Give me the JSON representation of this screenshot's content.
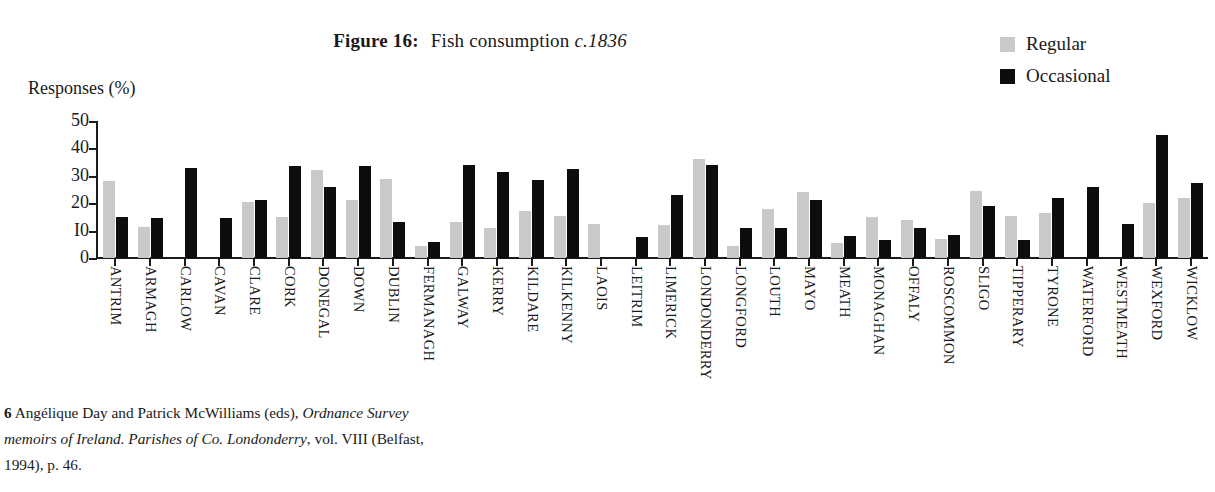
{
  "title": {
    "label": "Figure 16:",
    "caption": "Fish consumption",
    "circa": "c.1836",
    "full": "Figure 16: Fish consumption c.1836"
  },
  "legend": {
    "position": "top-right",
    "items": [
      {
        "label": "Regular",
        "color": "#c9c9c9",
        "key": "regular"
      },
      {
        "label": "Occasional",
        "color": "#0d0d0d",
        "key": "occasional"
      }
    ]
  },
  "axes": {
    "ylabel": "Responses (%)",
    "ytick_labels": [
      "50",
      "40",
      "30",
      "20",
      "I0",
      "0"
    ],
    "ytick_values": [
      50,
      40,
      30,
      20,
      10,
      0
    ],
    "xlabel": ""
  },
  "footnote": {
    "number": "6",
    "part1": "Angélique Day and Patrick McWilliams (eds), ",
    "italic1": "Ordnance Survey memoirs of Ireland. Parishes of Co. Londonderry",
    "part2": ", vol. VIII (Belfast, 1994), p. 46.",
    "full": "6 Angélique Day and Patrick McWilliams (eds), Ordnance Survey memoirs of Ireland. Parishes of Co. Londonderry, vol. VIII (Belfast, 1994), p. 46."
  },
  "chart_data": {
    "type": "bar",
    "title": "Figure 16: Fish consumption c.1836",
    "xlabel": "",
    "ylabel": "Responses (%)",
    "ylim": [
      0,
      50
    ],
    "ytick_step": 10,
    "grid": false,
    "legend_position": "top-right",
    "categories": [
      "ANTRIM",
      "ARMAGH",
      "CARLOW",
      "CAVAN",
      "CLARE",
      "CORK",
      "DONEGAL",
      "DOWN",
      "DUBLIN",
      "FERMANAGH",
      "GALWAY",
      "KERRY",
      "KILDARE",
      "KILKENNY",
      "LAOIS",
      "LEITRIM",
      "LIMERICK",
      "LONDONDERRY",
      "LONGFORD",
      "LOUTH",
      "MAYO",
      "MEATH",
      "MONAGHAN",
      "OFFALY",
      "ROSCOMMON",
      "SLIGO",
      "TIPPERARY",
      "TYRONE",
      "WATERFORD",
      "WESTMEATH",
      "WEXFORD",
      "WICKLOW"
    ],
    "series": [
      {
        "name": "Regular",
        "color": "#c9c9c9",
        "values": [
          28,
          11.5,
          0,
          0,
          20.5,
          15,
          32,
          21,
          29,
          4.5,
          13,
          11,
          17,
          15.5,
          12.5,
          0,
          12,
          36,
          4.5,
          18,
          24,
          5.5,
          15,
          14,
          7,
          24.5,
          15.5,
          16.5,
          0,
          0,
          20,
          22
        ]
      },
      {
        "name": "Occasional",
        "color": "#0d0d0d",
        "values": [
          15,
          14.5,
          33,
          14.5,
          21,
          33.5,
          26,
          33.5,
          13,
          6,
          34,
          31.5,
          28.5,
          32.5,
          0,
          7.5,
          23,
          34,
          11,
          11,
          21,
          8,
          6.5,
          11,
          8.5,
          19,
          6.5,
          22,
          26,
          12.5,
          45,
          27.5
        ]
      }
    ]
  }
}
